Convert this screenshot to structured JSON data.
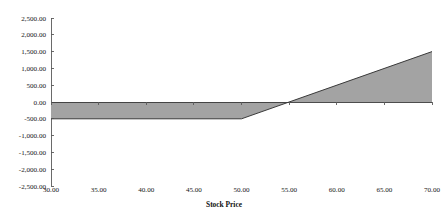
{
  "chart_data": {
    "type": "area",
    "title": "",
    "xlabel": "Stock Price",
    "ylabel": "",
    "x": [
      30,
      35,
      40,
      45,
      50,
      55,
      60,
      65,
      70
    ],
    "values": [
      -500,
      -500,
      -500,
      -500,
      -500,
      0,
      500,
      1000,
      1500
    ],
    "series": [
      {
        "name": "Payoff",
        "values": [
          -500,
          -500,
          -500,
          -500,
          -500,
          0,
          500,
          1000,
          1500
        ]
      }
    ],
    "vertices": [
      {
        "x": 30,
        "y": -500
      },
      {
        "x": 50,
        "y": -500
      },
      {
        "x": 70,
        "y": 1500
      }
    ],
    "xlim": [
      30,
      70
    ],
    "ylim": [
      -2500,
      2500
    ],
    "xtick_step": 5,
    "ytick_step": 500,
    "grid": false,
    "legend": false,
    "baseline": 0,
    "fill_color": "#a3a3a3",
    "line_color": "#3a3a3a",
    "axis_color": "#5a5a5a",
    "background_color": "#ffffff",
    "xtick_labels": [
      "30.00",
      "35.00",
      "40.00",
      "45.00",
      "50.00",
      "55.00",
      "60.00",
      "65.00",
      "70.00"
    ],
    "ytick_labels": [
      "2,500.00",
      "2,000.00",
      "1,500.00",
      "1,000.00",
      "500.00",
      "0.00",
      "-500.00",
      "-1,000.00",
      "-1,500.00",
      "-2,000.00",
      "-2,500.00"
    ],
    "ytick_values": [
      2500,
      2000,
      1500,
      1000,
      500,
      0,
      -500,
      -1000,
      -1500,
      -2000,
      -2500
    ]
  }
}
